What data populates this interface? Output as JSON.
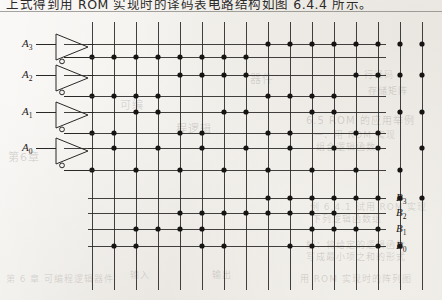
{
  "page": {
    "caption": "上式得到用 ROM 实现时的译码表电路结构如图 6.4.4 所示。",
    "background_color": "#f3f1ed",
    "ink_color": "#1d1b19"
  },
  "ghost_text": [
    {
      "text": "第6章",
      "x": 8,
      "y": 148,
      "size": 11
    },
    {
      "text": "可编",
      "x": 120,
      "y": 96,
      "size": 11
    },
    {
      "text": "程逻辑",
      "x": 176,
      "y": 120,
      "size": 11
    },
    {
      "text": "器件",
      "x": 250,
      "y": 70,
      "size": 11
    },
    {
      "text": "6.5  ROM 的应用举例",
      "x": 306,
      "y": 112,
      "size": 10
    },
    {
      "text": "一、用 ROM 实现",
      "x": 314,
      "y": 128,
      "size": 9
    },
    {
      "text": "组合逻辑函数",
      "x": 316,
      "y": 140,
      "size": 9
    },
    {
      "text": "例 6.4.1  试用 ROM 实现",
      "x": 310,
      "y": 200,
      "size": 9
    },
    {
      "text": "下列逻辑函数组",
      "x": 312,
      "y": 212,
      "size": 9
    },
    {
      "text": "解：将给定的逻辑函数",
      "x": 306,
      "y": 238,
      "size": 9
    },
    {
      "text": "写成最小项之和的形式",
      "x": 306,
      "y": 250,
      "size": 9
    },
    {
      "text": "第 6 章  可编程逻辑器件",
      "x": 6,
      "y": 272,
      "size": 9
    },
    {
      "text": "用 ROM 实现时的阵列图",
      "x": 300,
      "y": 272,
      "size": 9
    },
    {
      "text": "输入",
      "x": 130,
      "y": 268,
      "size": 9
    },
    {
      "text": "输出",
      "x": 212,
      "y": 268,
      "size": 9
    },
    {
      "text": "行译码",
      "x": 364,
      "y": 68,
      "size": 9
    },
    {
      "text": "存储矩阵",
      "x": 368,
      "y": 84,
      "size": 9
    }
  ],
  "diagram": {
    "inputs": {
      "label_prefix": "A",
      "items": [
        {
          "name": "A3",
          "letter": "A",
          "sub": "3"
        },
        {
          "name": "A2",
          "letter": "A",
          "sub": "2"
        },
        {
          "name": "A1",
          "letter": "A",
          "sub": "1"
        },
        {
          "name": "A0",
          "letter": "A",
          "sub": "0"
        }
      ]
    },
    "outputs": {
      "label_prefix": "B",
      "items": [
        {
          "name": "B3",
          "letter": "B",
          "sub": "3"
        },
        {
          "name": "B2",
          "letter": "B",
          "sub": "2"
        },
        {
          "name": "B1",
          "letter": "B",
          "sub": "1"
        },
        {
          "name": "B0",
          "letter": "B",
          "sub": "0"
        }
      ]
    },
    "grid": {
      "columns": 16,
      "col_x": [
        92,
        114,
        136,
        158,
        180,
        202,
        224,
        246,
        268,
        290,
        312,
        334,
        356,
        378,
        400,
        422
      ],
      "col_top": 22,
      "col_bottom": 290,
      "row_left": 0,
      "row_right": 388,
      "line_color": "#2a2826",
      "line_width": 1
    },
    "rows": [
      {
        "id": "A3",
        "y": 44,
        "kind": "input-true",
        "x_start": 64,
        "x_end": 386,
        "dot_cols": [
          9,
          10,
          11,
          12,
          13,
          14,
          15,
          16
        ]
      },
      {
        "id": "A3bar",
        "y": 57,
        "kind": "input-comp",
        "x_start": 64,
        "x_end": 386,
        "dot_cols": [
          1,
          2,
          3,
          4,
          5,
          6,
          7,
          8
        ]
      },
      {
        "id": "A2",
        "y": 75,
        "kind": "input-true",
        "x_start": 64,
        "x_end": 386,
        "dot_cols": [
          5,
          6,
          7,
          8,
          13,
          14,
          15,
          16
        ]
      },
      {
        "id": "A2bar",
        "y": 96,
        "kind": "input-comp",
        "x_start": 64,
        "x_end": 386,
        "dot_cols": [
          1,
          2,
          3,
          4,
          9,
          10,
          11,
          12
        ]
      },
      {
        "id": "A1",
        "y": 112,
        "kind": "input-true",
        "x_start": 64,
        "x_end": 386,
        "dot_cols": [
          3,
          4,
          7,
          8,
          11,
          12,
          15,
          16
        ]
      },
      {
        "id": "A1bar",
        "y": 133,
        "kind": "input-comp",
        "x_start": 64,
        "x_end": 386,
        "dot_cols": [
          1,
          2,
          5,
          6,
          9,
          10,
          13,
          14
        ]
      },
      {
        "id": "A0",
        "y": 148,
        "kind": "input-true",
        "x_start": 64,
        "x_end": 386,
        "dot_cols": [
          2,
          4,
          6,
          8,
          10,
          12,
          14,
          16
        ]
      },
      {
        "id": "A0bar",
        "y": 170,
        "kind": "input-comp",
        "x_start": 64,
        "x_end": 386,
        "dot_cols": [
          1,
          3,
          5,
          7,
          9,
          11,
          13,
          15
        ]
      },
      {
        "id": "B3",
        "y": 198,
        "kind": "output",
        "x_start": 88,
        "x_end": 386,
        "dot_cols": [
          9,
          10,
          11,
          12,
          13,
          14,
          15,
          16
        ]
      },
      {
        "id": "B2",
        "y": 213,
        "kind": "output",
        "x_start": 88,
        "x_end": 386,
        "dot_cols": [
          5,
          6,
          7,
          8,
          9,
          10,
          11,
          12
        ]
      },
      {
        "id": "B1",
        "y": 229,
        "kind": "output",
        "x_start": 88,
        "x_end": 386,
        "dot_cols": [
          3,
          4,
          5,
          6,
          11,
          12,
          13,
          14
        ]
      },
      {
        "id": "B0",
        "y": 246,
        "kind": "output",
        "x_start": 88,
        "x_end": 386,
        "dot_cols": [
          2,
          3,
          6,
          7,
          10,
          11,
          14,
          15
        ]
      }
    ],
    "inverters": [
      {
        "id": "inv-A3",
        "in_y": 44,
        "out_y": 57,
        "x": 56,
        "w": 32,
        "h": 26,
        "input_label": "A3"
      },
      {
        "id": "inv-A2",
        "in_y": 75,
        "out_y": 96,
        "x": 56,
        "w": 32,
        "h": 26,
        "input_label": "A2"
      },
      {
        "id": "inv-A1",
        "in_y": 112,
        "out_y": 133,
        "x": 56,
        "w": 32,
        "h": 26,
        "input_label": "A1"
      },
      {
        "id": "inv-A0",
        "in_y": 148,
        "out_y": 170,
        "x": 56,
        "w": 32,
        "h": 26,
        "input_label": "A0"
      }
    ],
    "dot_radius": 2.6,
    "dot_color": "#151413"
  }
}
